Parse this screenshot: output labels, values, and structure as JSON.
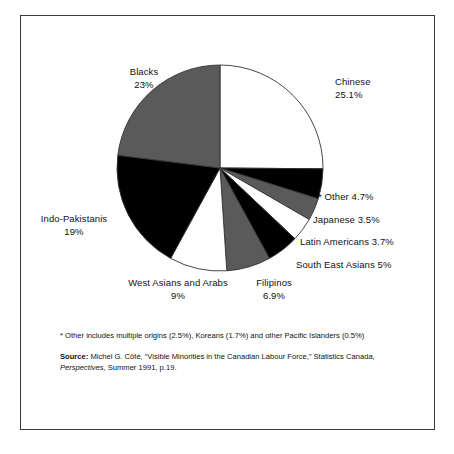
{
  "chart_data": {
    "type": "pie",
    "title": "",
    "start_angle_deg": 0,
    "direction": "clockwise",
    "categories": [
      "Chinese",
      "* Other",
      "Japanese",
      "Latin Americans",
      "South East Asians",
      "Filipinos",
      "West Asians and Arabs",
      "Indo-Pakistanis",
      "Blacks"
    ],
    "values": [
      25.1,
      4.7,
      3.5,
      3.7,
      5,
      6.9,
      9,
      19,
      23
    ],
    "unit": "%",
    "slices": [
      {
        "name": "Chinese",
        "value": 25.1,
        "value_label": "25.1%",
        "fill": "#ffffff",
        "label_line1": "Chinese",
        "label_line2": "25.1%"
      },
      {
        "name": "* Other",
        "value": 4.7,
        "value_label": "4.7%",
        "fill": "#000000",
        "label_line1": "* Other 4.7%",
        "label_line2": ""
      },
      {
        "name": "Japanese",
        "value": 3.5,
        "value_label": "3.5%",
        "fill": "#5a5a5a",
        "label_line1": "Japanese 3.5%",
        "label_line2": ""
      },
      {
        "name": "Latin Americans",
        "value": 3.7,
        "value_label": "3.7%",
        "fill": "#ffffff",
        "label_line1": "Latin Americans 3.7%",
        "label_line2": ""
      },
      {
        "name": "South East Asians",
        "value": 5,
        "value_label": "5%",
        "fill": "#000000",
        "label_line1": "South East Asians 5%",
        "label_line2": ""
      },
      {
        "name": "Filipinos",
        "value": 6.9,
        "value_label": "6.9%",
        "fill": "#5a5a5a",
        "label_line1": "Filipinos",
        "label_line2": "6.9%"
      },
      {
        "name": "West Asians and Arabs",
        "value": 9,
        "value_label": "9%",
        "fill": "#ffffff",
        "label_line1": "West Asians and Arabs",
        "label_line2": "9%"
      },
      {
        "name": "Indo-Pakistanis",
        "value": 19,
        "value_label": "19%",
        "fill": "#000000",
        "label_line1": "Indo-Pakistanis",
        "label_line2": "19%"
      },
      {
        "name": "Blacks",
        "value": 23,
        "value_label": "23%",
        "fill": "#5a5a5a",
        "label_line1": "Blacks",
        "label_line2": "23%"
      }
    ],
    "legend_position": "callout-labels",
    "grid": false
  },
  "notes": {
    "other_footnote": "* Other includes multiple origins (2.5%), Koreans (1.7%) and other Pacific Islanders (0.5%)",
    "source_label": "Source:",
    "source_part1": " Michel G. Côté, “Visible Minorities in the Canadian Labour Force,” Statistics Canada, ",
    "source_italic": "Perspectives",
    "source_part2": ", Summer 1991, p.19."
  },
  "colors": {
    "white_slice": "#ffffff",
    "gray_slice": "#5a5a5a",
    "black_slice": "#000000",
    "outline": "#333333",
    "frame_border": "#3a3a3a",
    "background": "#ffffff",
    "text": "#111111"
  }
}
